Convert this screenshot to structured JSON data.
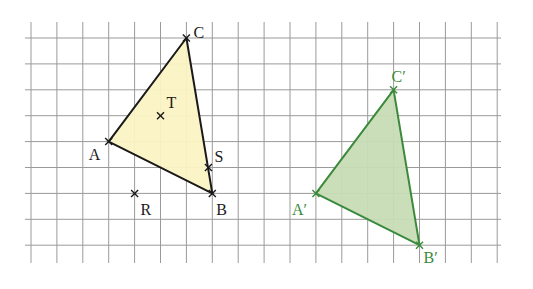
{
  "figure": {
    "grid": {
      "origin_x": 31,
      "origin_y": 38,
      "cell": 25.9,
      "cols": 18,
      "rows": 8,
      "line_color": "#9a9a9a",
      "v_line_top": 22,
      "v_line_bottom": 263,
      "h_line_left": 25,
      "h_line_right": 501
    },
    "original_triangle": {
      "name": "ABC",
      "fill": "#fbf3c4",
      "stroke": "#1a1a1a",
      "label_color": "#1a1a1a",
      "vertices": [
        {
          "id": "A",
          "label": "A",
          "col": 3,
          "row": 4,
          "label_dx": -20,
          "label_dy": 18
        },
        {
          "id": "B",
          "label": "B",
          "col": 7,
          "row": 6,
          "label_dx": 4,
          "label_dy": 22
        },
        {
          "id": "C",
          "label": "C",
          "col": 6,
          "row": 0,
          "label_dx": 7,
          "label_dy": 0
        }
      ]
    },
    "points": [
      {
        "id": "T",
        "label": "T",
        "col": 5,
        "row": 3,
        "label_dx": 6,
        "label_dy": -8
      },
      {
        "id": "S",
        "label": "S",
        "col": 6.85,
        "row": 5,
        "label_dx": 6,
        "label_dy": -6
      },
      {
        "id": "R",
        "label": "R",
        "col": 4,
        "row": 6,
        "label_dx": 6,
        "label_dy": 22
      }
    ],
    "image_triangle": {
      "name": "A'B'C'",
      "fill": "#c8dcb6",
      "stroke": "#3b8a3b",
      "label_color": "#3b8a3b",
      "vertices": [
        {
          "id": "A'",
          "label": "A′",
          "col": 11,
          "row": 6,
          "label_dx": -24,
          "label_dy": 22
        },
        {
          "id": "B'",
          "label": "B′",
          "col": 15,
          "row": 8,
          "label_dx": 4,
          "label_dy": 18
        },
        {
          "id": "C'",
          "label": "C′",
          "col": 14,
          "row": 2,
          "label_dx": -2,
          "label_dy": -8
        }
      ]
    },
    "translation_vector": {
      "dx_cells": 8,
      "dy_cells": 2
    }
  }
}
